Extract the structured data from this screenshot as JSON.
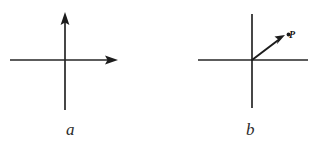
{
  "figure": {
    "width": 314,
    "height": 148,
    "background_color": "#ffffff",
    "ink_color": "#262626",
    "vector_color": "#1c1c1c",
    "panels": [
      {
        "id": "a",
        "caption": "a",
        "description": "coordinate axes with arrowheads on positive x and positive y",
        "origin": {
          "x": 65,
          "y": 60
        },
        "x_axis": {
          "from_x": 10,
          "to_x": 118,
          "y": 60,
          "arrow_at": "right"
        },
        "y_axis": {
          "x": 65,
          "from_y": 110,
          "to_y": 12,
          "arrow_at": "top"
        },
        "vectors": [],
        "points": []
      },
      {
        "id": "b",
        "caption": "b",
        "description": "coordinate axes without arrowheads, with a position vector drawn to point P",
        "origin": {
          "x": 252,
          "y": 60
        },
        "x_axis": {
          "from_x": 198,
          "to_x": 308,
          "y": 60,
          "arrow_at": "none"
        },
        "y_axis": {
          "x": 252,
          "from_y": 108,
          "to_y": 14,
          "arrow_at": "none"
        },
        "vectors": [
          {
            "name": "position-vector",
            "from": {
              "x": 252,
              "y": 60
            },
            "to": {
              "x": 284,
              "y": 36
            },
            "arrow_at": "end"
          }
        ],
        "points": [
          {
            "name": "point-p",
            "label": "P",
            "x": 288,
            "y": 35
          }
        ]
      }
    ]
  }
}
